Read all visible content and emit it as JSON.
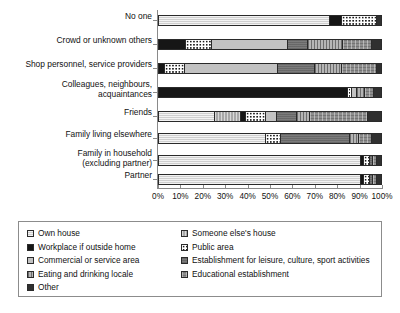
{
  "chart_data": {
    "type": "bar",
    "orientation": "horizontal",
    "stacked": true,
    "normalized_percent": true,
    "title": "",
    "subtitle": "",
    "xlabel": "",
    "ylabel": "",
    "xlim": [
      0,
      100
    ],
    "grid": false,
    "legend_position": "bottom",
    "x_ticks": [
      "0%",
      "10%",
      "20%",
      "30%",
      "40%",
      "50%",
      "60%",
      "70%",
      "80%",
      "90%",
      "100%"
    ],
    "x_tick_values": [
      0,
      10,
      20,
      30,
      40,
      50,
      60,
      70,
      80,
      90,
      100
    ],
    "categories": [
      "No one",
      "Crowd or unknown others",
      "Shop personnel, service providers",
      "Colleagues, neighbours,\nacquaintances",
      "Friends",
      "Family living elsewhere",
      "Family in household\n(excluding partner)",
      "Partner"
    ],
    "series": [
      {
        "name": "Own house",
        "pattern": "p0",
        "values": [
          77.0,
          0.0,
          0.0,
          0.0,
          25.0,
          48.0,
          91.0,
          91.0
        ]
      },
      {
        "name": "Someone else's house",
        "pattern": "p1",
        "values": [
          0.0,
          0.0,
          0.0,
          0.0,
          12.0,
          0.0,
          0.0,
          0.0
        ]
      },
      {
        "name": "Workplace if outside home",
        "pattern": "p2",
        "values": [
          5.5,
          12.0,
          2.5,
          85.0,
          2.0,
          0.0,
          1.5,
          1.5
        ]
      },
      {
        "name": "Public area",
        "pattern": "p3",
        "values": [
          15.5,
          12.0,
          9.0,
          2.0,
          9.0,
          7.0,
          2.5,
          2.5
        ]
      },
      {
        "name": "Commercial or service area",
        "pattern": "p4",
        "values": [
          0.0,
          34.0,
          42.0,
          2.0,
          5.0,
          0.0,
          0.0,
          0.0
        ]
      },
      {
        "name": "Establishment for leisure, culture, sport activities",
        "pattern": "p5",
        "values": [
          0.0,
          9.0,
          17.0,
          0.0,
          9.0,
          31.0,
          1.5,
          1.5
        ]
      },
      {
        "name": "Eating and drinking locale",
        "pattern": "p6",
        "values": [
          0.0,
          16.0,
          12.0,
          4.0,
          6.0,
          4.0,
          0.0,
          0.0
        ]
      },
      {
        "name": "Educational establishment",
        "pattern": "p7",
        "values": [
          0.0,
          13.0,
          15.5,
          4.0,
          26.0,
          6.0,
          1.5,
          1.5
        ]
      },
      {
        "name": "Other",
        "pattern": "p8",
        "values": [
          2.0,
          4.0,
          2.0,
          3.0,
          6.0,
          4.0,
          2.0,
          2.0
        ]
      }
    ]
  },
  "legend": {
    "left_column": [
      {
        "label": "Own house",
        "pattern": "p0"
      },
      {
        "label": "Workplace if outside home",
        "pattern": "p2"
      },
      {
        "label": "Commercial or service area",
        "pattern": "p4"
      },
      {
        "label": "Eating and drinking locale",
        "pattern": "p6"
      },
      {
        "label": "Other",
        "pattern": "p8"
      }
    ],
    "right_column": [
      {
        "label": "Someone else's house",
        "pattern": "p1"
      },
      {
        "label": "Public area",
        "pattern": "p3"
      },
      {
        "label": "Establishment for leisure, culture, sport activities",
        "pattern": "p5"
      },
      {
        "label": "Educational establishment",
        "pattern": "p7"
      }
    ]
  }
}
